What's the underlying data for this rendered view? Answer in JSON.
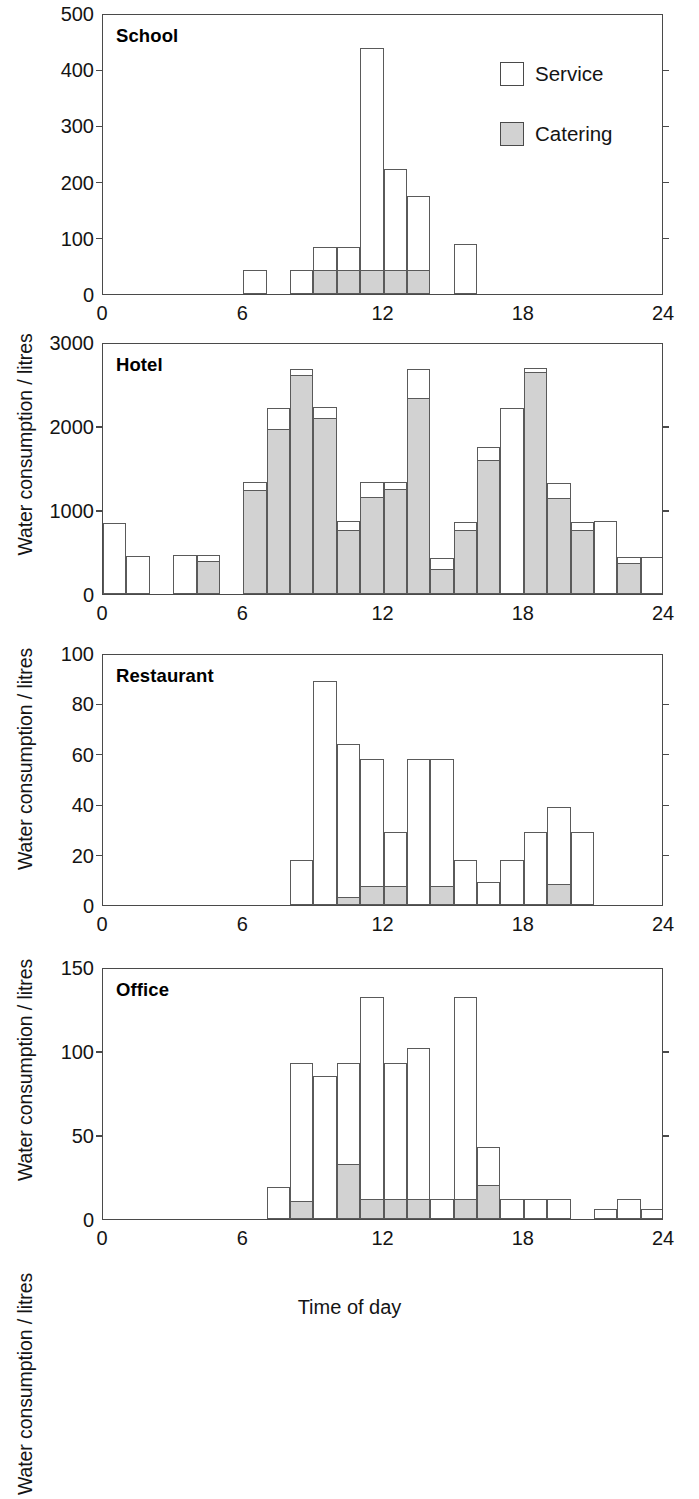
{
  "figure": {
    "xlabel": "Time of day",
    "ylabel": "Water consumption / litres",
    "legend": {
      "service_label": "Service",
      "catering_label": "Catering",
      "service_color": "#ffffff",
      "catering_color": "#d2d2d2"
    }
  },
  "chart_data": [
    {
      "type": "bar",
      "title": "School",
      "xlabel": "Time of day",
      "ylabel": "Water consumption / litres",
      "xlim": [
        0,
        24
      ],
      "ylim": [
        0,
        500
      ],
      "xticks": [
        0,
        6,
        12,
        18,
        24
      ],
      "yticks": [
        0,
        100,
        200,
        300,
        400,
        500
      ],
      "grid": false,
      "legend_position": "top-right",
      "bin_width_hours": 1,
      "x": [
        0,
        1,
        2,
        3,
        4,
        5,
        6,
        7,
        8,
        9,
        10,
        11,
        12,
        13,
        14,
        15,
        16,
        17,
        18,
        19,
        20,
        21,
        22,
        23
      ],
      "series": [
        {
          "name": "Service",
          "values": [
            0,
            0,
            0,
            0,
            0,
            0,
            42,
            0,
            42,
            83,
            83,
            437,
            222,
            174,
            0,
            89,
            0,
            0,
            0,
            0,
            0,
            0,
            0,
            0
          ]
        },
        {
          "name": "Catering",
          "values": [
            0,
            0,
            0,
            0,
            0,
            0,
            0,
            0,
            0,
            42,
            42,
            42,
            42,
            42,
            0,
            0,
            0,
            0,
            0,
            0,
            0,
            0,
            0,
            0
          ]
        }
      ]
    },
    {
      "type": "bar",
      "title": "Hotel",
      "xlabel": "Time of day",
      "ylabel": "Water consumption / litres",
      "xlim": [
        0,
        24
      ],
      "ylim": [
        0,
        3000
      ],
      "xticks": [
        0,
        6,
        12,
        18,
        24
      ],
      "yticks": [
        0,
        1000,
        2000,
        3000
      ],
      "grid": false,
      "bin_width_hours": 1,
      "x": [
        0,
        1,
        2,
        3,
        4,
        5,
        6,
        7,
        8,
        9,
        10,
        11,
        12,
        13,
        14,
        15,
        16,
        17,
        18,
        19,
        20,
        21,
        22,
        23
      ],
      "series": [
        {
          "name": "Service",
          "values": [
            850,
            450,
            0,
            460,
            460,
            0,
            1330,
            2220,
            2680,
            2230,
            870,
            1330,
            1330,
            2680,
            430,
            860,
            1750,
            2210,
            2690,
            1320,
            860,
            870,
            440,
            440
          ]
        },
        {
          "name": "Catering",
          "values": [
            0,
            0,
            0,
            0,
            390,
            0,
            1240,
            1960,
            2610,
            2100,
            760,
            1150,
            1250,
            2330,
            300,
            760,
            1600,
            0,
            2640,
            1140,
            760,
            0,
            370,
            0
          ]
        }
      ]
    },
    {
      "type": "bar",
      "title": "Restaurant",
      "xlabel": "Time of day",
      "ylabel": "Water consumption / litres",
      "xlim": [
        0,
        24
      ],
      "ylim": [
        0,
        100
      ],
      "xticks": [
        0,
        6,
        12,
        18,
        24
      ],
      "yticks": [
        0,
        20,
        40,
        60,
        80,
        100
      ],
      "grid": false,
      "bin_width_hours": 1,
      "x": [
        0,
        1,
        2,
        3,
        4,
        5,
        6,
        7,
        8,
        9,
        10,
        11,
        12,
        13,
        14,
        15,
        16,
        17,
        18,
        19,
        20,
        21,
        22,
        23
      ],
      "series": [
        {
          "name": "Service",
          "values": [
            0,
            0,
            0,
            0,
            0,
            0,
            0,
            0,
            18,
            89,
            64,
            58,
            29,
            58,
            58,
            18,
            9,
            18,
            29,
            39,
            29,
            0,
            0,
            0
          ]
        },
        {
          "name": "Catering",
          "values": [
            0,
            0,
            0,
            0,
            0,
            0,
            0,
            0,
            0,
            0,
            3,
            7.5,
            7.5,
            0,
            7.5,
            0,
            0,
            0,
            0,
            8.5,
            0,
            0,
            0,
            0
          ]
        }
      ]
    },
    {
      "type": "bar",
      "title": "Office",
      "xlabel": "Time of day",
      "ylabel": "Water consumption / litres",
      "xlim": [
        0,
        24
      ],
      "ylim": [
        0,
        150
      ],
      "xticks": [
        0,
        6,
        12,
        18,
        24
      ],
      "yticks": [
        0,
        50,
        100,
        150
      ],
      "grid": false,
      "bin_width_hours": 1,
      "x": [
        0,
        1,
        2,
        3,
        4,
        5,
        6,
        7,
        8,
        9,
        10,
        11,
        12,
        13,
        14,
        15,
        16,
        17,
        18,
        19,
        20,
        21,
        22,
        23
      ],
      "series": [
        {
          "name": "Service",
          "values": [
            0,
            0,
            0,
            0,
            0,
            0,
            0,
            19,
            93,
            85,
            93,
            132,
            93,
            102,
            12,
            132,
            43,
            12,
            12,
            12,
            0,
            6,
            12,
            6
          ]
        },
        {
          "name": "Catering",
          "values": [
            0,
            0,
            0,
            0,
            0,
            0,
            0,
            0,
            11,
            0,
            33,
            12,
            12,
            12,
            0,
            12,
            20,
            0,
            0,
            0,
            0,
            0,
            0,
            0
          ]
        }
      ]
    }
  ]
}
